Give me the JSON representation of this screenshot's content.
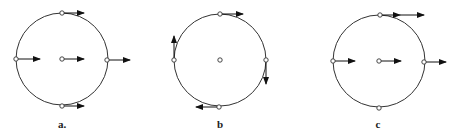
{
  "diagram": {
    "stroke_color": "#333333",
    "panels": [
      {
        "label": "a.",
        "name": "translation",
        "center": [
          62,
          59
        ],
        "radius": 46,
        "vectors": [
          {
            "point": "top",
            "from": [
              62,
              13
            ],
            "to": [
              84,
              13
            ]
          },
          {
            "point": "left",
            "from": [
              16,
              59
            ],
            "to": [
              40,
              59
            ]
          },
          {
            "point": "center",
            "from": [
              62,
              59
            ],
            "to": [
              84,
              59
            ]
          },
          {
            "point": "right",
            "from": [
              107,
              60
            ],
            "to": [
              130,
              60
            ]
          },
          {
            "point": "bottom",
            "from": [
              62,
              106
            ],
            "to": [
              84,
              106
            ]
          }
        ]
      },
      {
        "label": "b",
        "name": "rotation",
        "center": [
          220,
          60
        ],
        "radius": 46,
        "vectors": [
          {
            "point": "top",
            "from": [
              220,
              14
            ],
            "to": [
              243,
              14
            ]
          },
          {
            "point": "left",
            "from": [
              174,
              60
            ],
            "to": [
              174,
              36
            ]
          },
          {
            "point": "right",
            "from": [
              266,
              60
            ],
            "to": [
              266,
              84
            ]
          },
          {
            "point": "bottom",
            "from": [
              219,
              107
            ],
            "to": [
              196,
              107
            ]
          }
        ]
      },
      {
        "label": "c",
        "name": "rolling",
        "center": [
          379,
          61
        ],
        "radius": 46,
        "vectors": [
          {
            "point": "top",
            "from": [
              380,
              15
            ],
            "to": [
              400,
              15
            ]
          },
          {
            "point": "top-extra",
            "from": [
              400,
              15
            ],
            "to": [
              424,
              15
            ]
          },
          {
            "point": "left",
            "from": [
              333,
              61
            ],
            "to": [
              355,
              61
            ]
          },
          {
            "point": "center",
            "from": [
              379,
              61
            ],
            "to": [
              401,
              61
            ]
          },
          {
            "point": "right",
            "from": [
              424,
              62
            ],
            "to": [
              446,
              62
            ]
          }
        ],
        "bottom_point": [
          379,
          108
        ]
      }
    ]
  }
}
